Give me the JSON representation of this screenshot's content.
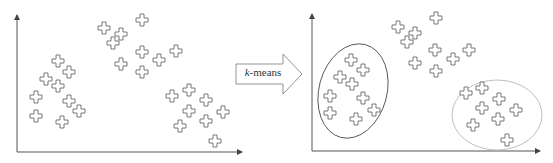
{
  "figure": {
    "arrow_label_italic": "k",
    "arrow_label_rest": "-means",
    "colors": {
      "axis": "#555555",
      "point_stroke": "#6a6a6a",
      "cluster1_ellipse": "#555555",
      "cluster3_ellipse": "#b8b8b8"
    }
  },
  "left_plot": {
    "points": {
      "cluster_left": [
        [
          58,
          61
        ],
        [
          69,
          72
        ],
        [
          46,
          79
        ],
        [
          58,
          86
        ],
        [
          36,
          97
        ],
        [
          69,
          101
        ],
        [
          36,
          116
        ],
        [
          79,
          111
        ],
        [
          62,
          122
        ]
      ],
      "cluster_top": [
        [
          104,
          28
        ],
        [
          121,
          34
        ],
        [
          113,
          43
        ],
        [
          142,
          20
        ],
        [
          121,
          64
        ],
        [
          142,
          52
        ],
        [
          142,
          72
        ],
        [
          159,
          60
        ],
        [
          176,
          51
        ]
      ],
      "cluster_right": [
        [
          172,
          96
        ],
        [
          189,
          90
        ],
        [
          206,
          100
        ],
        [
          189,
          111
        ],
        [
          223,
          112
        ],
        [
          180,
          126
        ],
        [
          206,
          121
        ],
        [
          215,
          141
        ]
      ]
    }
  },
  "right_plot": {
    "points": {
      "cluster_left": [
        [
          351,
          60
        ],
        [
          363,
          70
        ],
        [
          340,
          77
        ],
        [
          352,
          84
        ],
        [
          330,
          96
        ],
        [
          363,
          98
        ],
        [
          330,
          113
        ],
        [
          374,
          110
        ],
        [
          356,
          119
        ]
      ],
      "cluster_top": [
        [
          398,
          27
        ],
        [
          415,
          33
        ],
        [
          407,
          42
        ],
        [
          436,
          18
        ],
        [
          415,
          63
        ],
        [
          435,
          50
        ],
        [
          436,
          71
        ],
        [
          453,
          59
        ],
        [
          469,
          50
        ]
      ],
      "cluster_right": [
        [
          466,
          93
        ],
        [
          482,
          88
        ],
        [
          499,
          99
        ],
        [
          482,
          108
        ],
        [
          516,
          110
        ],
        [
          473,
          125
        ],
        [
          498,
          119
        ],
        [
          507,
          140
        ]
      ]
    },
    "ellipses": [
      {
        "name": "cluster-left-ellipse",
        "cx": 353,
        "cy": 91,
        "rx": 34,
        "ry": 48,
        "rotate": 15
      },
      {
        "name": "cluster-right-ellipse",
        "cx": 497,
        "cy": 115,
        "rx": 45,
        "ry": 35,
        "rotate": 0
      }
    ]
  }
}
